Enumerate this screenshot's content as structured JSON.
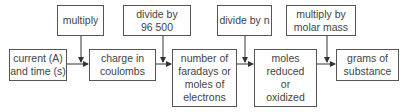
{
  "diagram": {
    "type": "flowchart",
    "steps": [
      {
        "id": "current",
        "label": "current (A)\nand time (s)"
      },
      {
        "id": "charge",
        "label": "charge in\ncoulombs"
      },
      {
        "id": "faradays",
        "label": "number of\nfaradays or\nmoles of\nelectrons"
      },
      {
        "id": "moles",
        "label": "moles\nreduced\nor\noxidized"
      },
      {
        "id": "grams",
        "label": "grams of\nsubstance"
      }
    ],
    "operations": [
      {
        "id": "op1",
        "label": "multiply",
        "between": [
          "current",
          "charge"
        ]
      },
      {
        "id": "op2",
        "label": "divide by\n96 500",
        "between": [
          "charge",
          "faradays"
        ]
      },
      {
        "id": "op3",
        "label": "divide by n",
        "between": [
          "faradays",
          "moles"
        ]
      },
      {
        "id": "op4",
        "label": "multiply by\nmolar mass",
        "between": [
          "moles",
          "grams"
        ]
      }
    ],
    "colors": {
      "border": "#555555",
      "text": "#444444",
      "line": "#333333"
    }
  }
}
